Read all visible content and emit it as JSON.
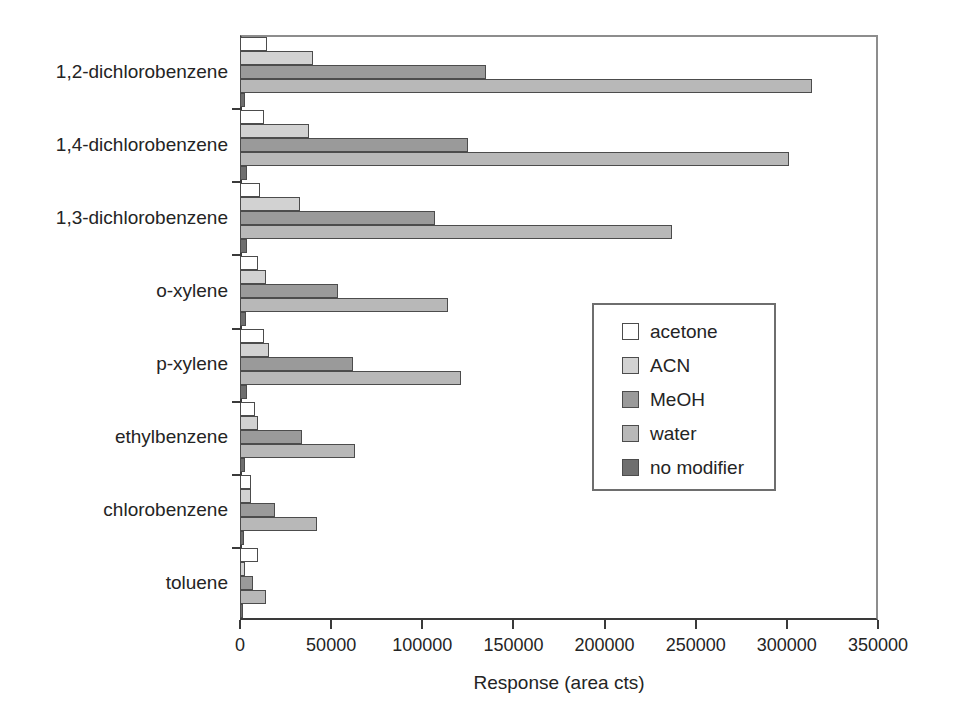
{
  "chart_data": {
    "type": "bar",
    "orientation": "horizontal",
    "title": "",
    "xlabel": "Response (area cts)",
    "ylabel": "",
    "xlim": [
      0,
      350000
    ],
    "xticks": [
      0,
      50000,
      100000,
      150000,
      200000,
      250000,
      300000,
      350000
    ],
    "xtick_labels": [
      "0",
      "50000",
      "100000",
      "150000",
      "200000",
      "250000",
      "300000",
      "350000"
    ],
    "grid": false,
    "legend_position": "center-right",
    "categories": [
      "1,2-dichlorobenzene",
      "1,4-dichlorobenzene",
      "1,3-dichlorobenzene",
      "o-xylene",
      "p-xylene",
      "ethylbenzene",
      "chlorobenzene",
      "toluene"
    ],
    "series": [
      {
        "name": "acetone",
        "color": "#ffffff",
        "values": [
          15000,
          13000,
          11000,
          10000,
          13000,
          8000,
          6000,
          10000
        ]
      },
      {
        "name": "ACN",
        "color": "#d2d2d2",
        "values": [
          40000,
          38000,
          33000,
          14000,
          16000,
          10000,
          6000,
          3000
        ]
      },
      {
        "name": "MeOH",
        "color": "#9a9a9a",
        "values": [
          135000,
          125000,
          107000,
          54000,
          62000,
          34000,
          19000,
          7000
        ]
      },
      {
        "name": "water",
        "color": "#b8b8b8",
        "values": [
          314000,
          301000,
          237000,
          114000,
          121000,
          63000,
          42000,
          14000
        ]
      },
      {
        "name": "no modifier",
        "color": "#6f6f6f",
        "values": [
          2500,
          4000,
          4000,
          3500,
          4000,
          2500,
          2000,
          1500
        ]
      }
    ]
  },
  "legend": {
    "entries": [
      {
        "label": "acetone",
        "color": "#ffffff"
      },
      {
        "label": "ACN",
        "color": "#d2d2d2"
      },
      {
        "label": "MeOH",
        "color": "#9a9a9a"
      },
      {
        "label": "water",
        "color": "#b8b8b8"
      },
      {
        "label": "no modifier",
        "color": "#6f6f6f"
      }
    ]
  },
  "axis": {
    "x_title": "Response (area cts)"
  },
  "colors": {
    "frame": "#8d8d8d",
    "axis": "#3a3a3a",
    "bar_outline": "#4c4c4c",
    "text": "#242424"
  }
}
